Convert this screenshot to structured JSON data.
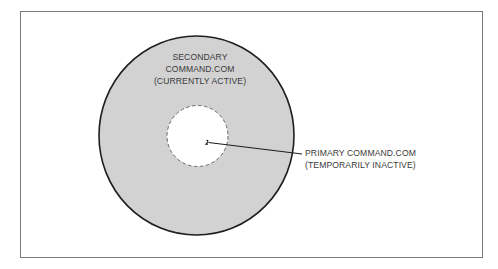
{
  "diagram": {
    "type": "nested-circle",
    "colors": {
      "outer_fill": "#d2d2d2",
      "outer_stroke": "#1e1e1e",
      "inner_fill": "#ffffff",
      "inner_stroke": "#6a6a6a",
      "frame": "#7a7a7a",
      "text": "#3a3a3a"
    },
    "outer_region": {
      "label_lines": [
        "SECONDARY",
        "COMMAND.COM",
        "(CURRENTLY ACTIVE)"
      ]
    },
    "inner_region": {
      "style": "dashed",
      "callout_lines": [
        "PRIMARY COMMAND.COM",
        "(TEMPORARILY INACTIVE)"
      ]
    }
  }
}
